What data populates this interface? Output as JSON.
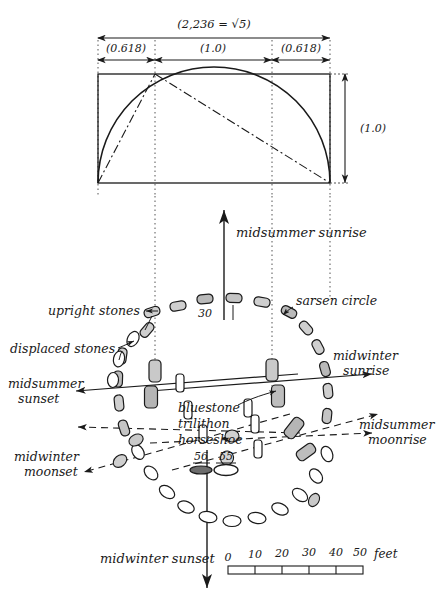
{
  "figure": {
    "kind": "hand-drawn-archaeoastronomy-plan"
  },
  "top_diagram": {
    "total_label": "(2,236 = √5)",
    "segment_labels": [
      "(0.618)",
      "(1.0)",
      "(0.618)"
    ],
    "height_label": "(1.0)",
    "shapes": [
      "rectangle",
      "semicircle-arc",
      "dash-dot diagonals",
      "dotted verticals"
    ]
  },
  "plan_labels": {
    "upright_stones": "upright stones",
    "displaced_stones": "displaced stones",
    "sarsen_circle": "sarsen circle",
    "bluestone": "bluestone",
    "trilithon": "trilithon",
    "horseshoe": "horseshoe",
    "stone_30": "30",
    "stone_56": "56",
    "stone_55": "55"
  },
  "alignments": {
    "midsummer_sunrise": "midsummer sunrise",
    "midwinter_sunrise_line1": "midwinter",
    "midwinter_sunrise_line2": "sunrise",
    "midsummer_moonrise_line1": "midsummer",
    "midsummer_moonrise_line2": "moonrise",
    "midsummer_sunset_line1": "midsummer",
    "midsummer_sunset_line2": "sunset",
    "midwinter_moonset_line1": "midwinter",
    "midwinter_moonset_line2": "moonset",
    "midwinter_sunset": "midwinter sunset"
  },
  "scale_bar": {
    "ticks": [
      "0",
      "10",
      "20",
      "30",
      "40",
      "50"
    ],
    "unit": "feet"
  },
  "colors": {
    "ink": "#1a1a1a",
    "paper": "#ffffff",
    "dotted": "#555555"
  }
}
